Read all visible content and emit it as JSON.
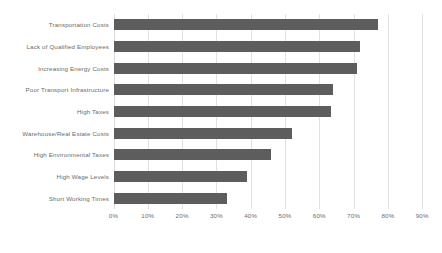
{
  "chart_data": {
    "type": "bar",
    "orientation": "horizontal",
    "title": "",
    "subtitle": "",
    "xlabel": "",
    "ylabel": "",
    "categories": [
      "Transportation Costs",
      "Lack of Qualified Employees",
      "Increasing Energy Costs",
      "Poor Transport Infrastructure",
      "High Taxes",
      "Warehouse/Real Estate Costs",
      "High Environmental Taxes",
      "High Wage Levels",
      "Short Working Times"
    ],
    "values": [
      77,
      72,
      71,
      64,
      63.5,
      52,
      46,
      39,
      33
    ],
    "value_suffix": "%",
    "xlim": [
      0,
      90
    ],
    "xticks": [
      0,
      10,
      20,
      30,
      40,
      50,
      60,
      70,
      80,
      90
    ],
    "xtick_labels": [
      "0%",
      "10%",
      "20%",
      "30%",
      "40%",
      "50%",
      "60%",
      "70%",
      "80%",
      "90%"
    ],
    "grid": "vertical",
    "legend": "none",
    "series": [
      {
        "name": "Share of respondents",
        "color": "#5d5d5d",
        "values": [
          77,
          72,
          71,
          64,
          63.5,
          52,
          46,
          39,
          33
        ]
      }
    ],
    "colors": {
      "bar": "#5d5d5d",
      "gridline": "#e2e2e2",
      "text": "#6b6b6b",
      "background": "#ffffff"
    }
  }
}
